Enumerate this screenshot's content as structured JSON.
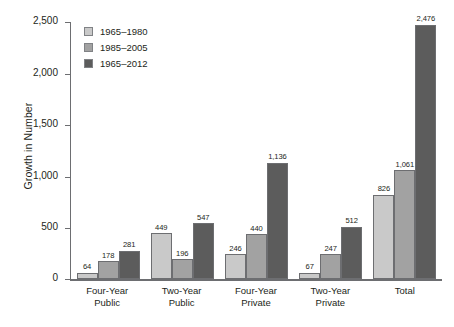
{
  "chart_data": {
    "type": "bar",
    "title": "",
    "xlabel": "",
    "ylabel": "Growth in Number",
    "ylim": [
      0,
      2500
    ],
    "yticks": [
      0,
      500,
      1000,
      1500,
      2000,
      2500
    ],
    "ytick_labels": [
      "0",
      "500",
      "1,000",
      "1,500",
      "2,000",
      "2,500"
    ],
    "grid": false,
    "legend_position": "top-left",
    "categories": [
      {
        "line1": "Four-Year",
        "line2": "Public"
      },
      {
        "line1": "Two-Year",
        "line2": "Public"
      },
      {
        "line1": "Four-Year",
        "line2": "Private"
      },
      {
        "line1": "Two-Year",
        "line2": "Private"
      },
      {
        "line1": "Total",
        "line2": ""
      }
    ],
    "series": [
      {
        "name": "1965–1980",
        "color": "#c9c9c9",
        "values": [
          64,
          449,
          246,
          67,
          826
        ],
        "labels": [
          "64",
          "449",
          "246",
          "67",
          "826"
        ]
      },
      {
        "name": "1985–2005",
        "color": "#a2a2a2",
        "values": [
          178,
          196,
          440,
          247,
          1061
        ],
        "labels": [
          "178",
          "196",
          "440",
          "247",
          "1,061"
        ]
      },
      {
        "name": "1965–2012",
        "color": "#5c5c5c",
        "values": [
          281,
          547,
          1136,
          512,
          2476
        ],
        "labels": [
          "281",
          "547",
          "1,136",
          "512",
          "2,476"
        ]
      }
    ]
  }
}
